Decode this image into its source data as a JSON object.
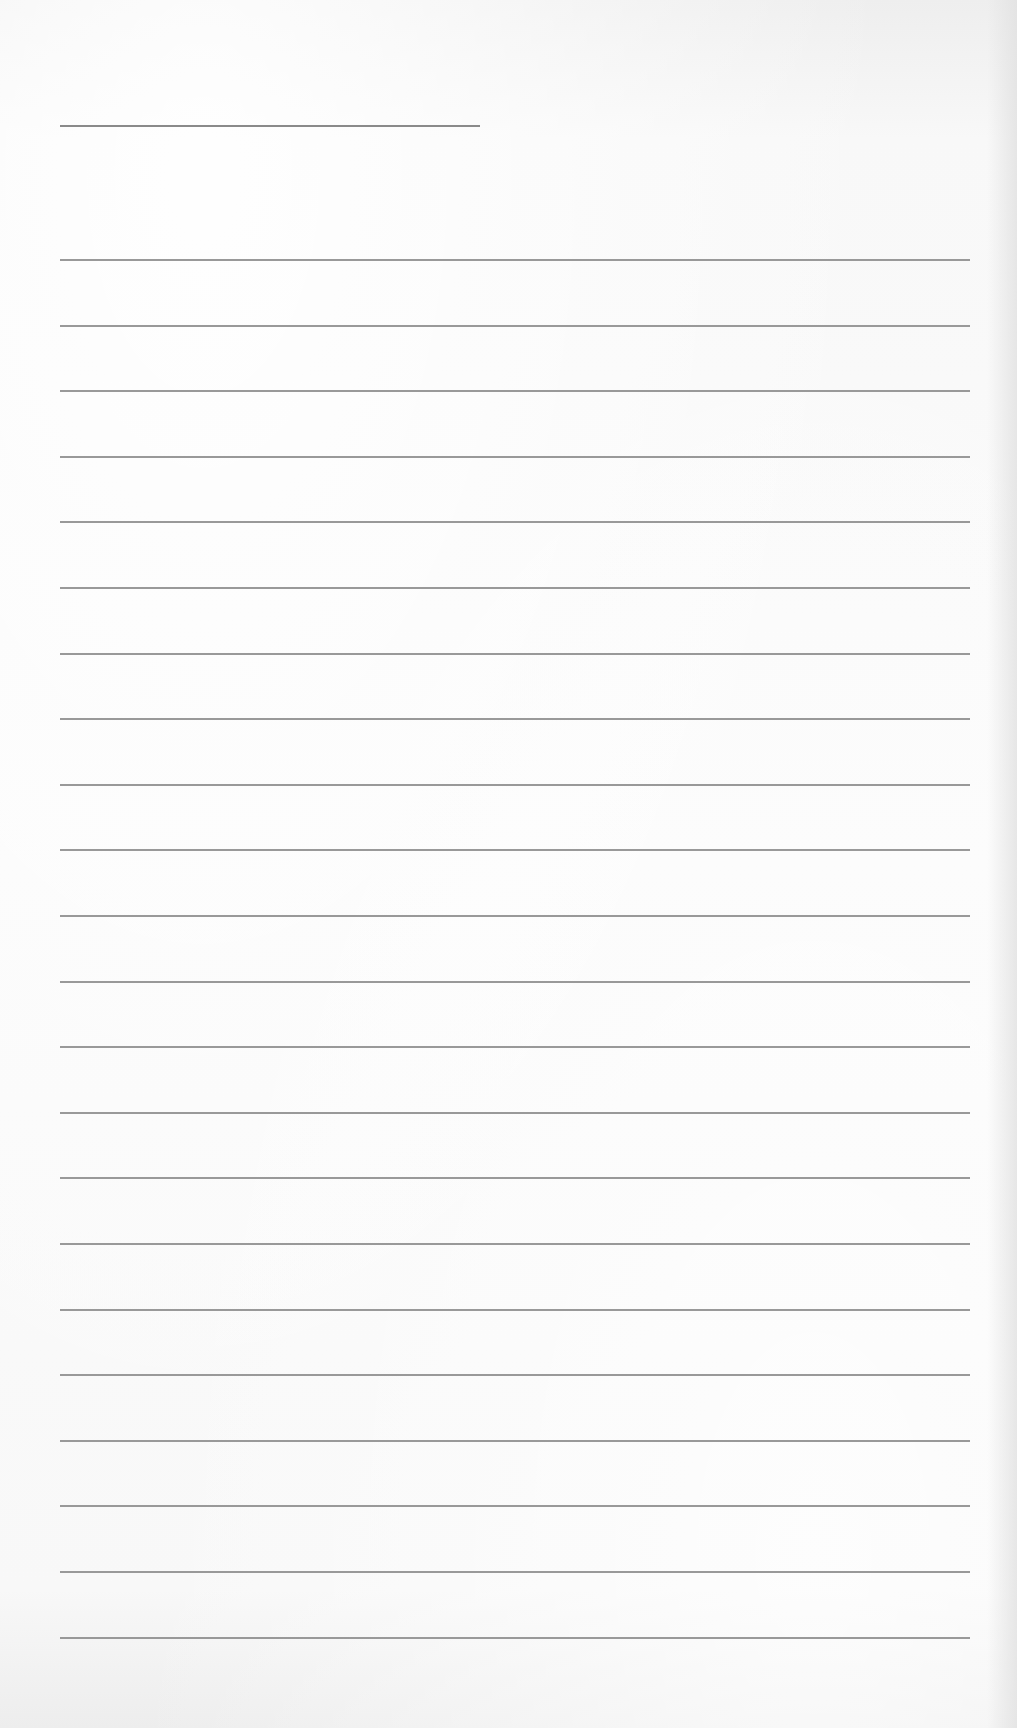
{
  "page": {
    "type": "ruled-writing-sheet",
    "background_color": "#f8f8f8",
    "line_color": "#8e8e8e"
  },
  "title_line": {
    "visible": true,
    "text": ""
  },
  "ruled_lines": {
    "count": 22,
    "first_y": 259,
    "spacing": 65.6,
    "entries": [
      "",
      "",
      "",
      "",
      "",
      "",
      "",
      "",
      "",
      "",
      "",
      "",
      "",
      "",
      "",
      "",
      "",
      "",
      "",
      "",
      "",
      ""
    ]
  }
}
